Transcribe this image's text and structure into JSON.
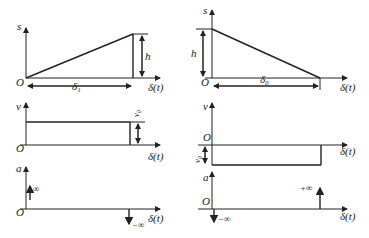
{
  "figure": {
    "left": {
      "displacement": {
        "y_label": "s",
        "origin": "O",
        "x_label": "δ(t)",
        "height_label": "h",
        "interval_label": "δ₁"
      },
      "velocity": {
        "y_label": "v",
        "origin": "O",
        "x_label": "δ(t)",
        "value_label": "v₀"
      },
      "acceleration": {
        "y_label": "a",
        "origin": "O",
        "x_label": "δ(t)",
        "start_impulse": "∞",
        "end_impulse": "−∞"
      }
    },
    "right": {
      "displacement": {
        "y_label": "s",
        "origin": "O",
        "x_label": "δ(t)",
        "height_label": "h",
        "interval_label": "δ₀"
      },
      "velocity": {
        "y_label": "v",
        "origin": "O",
        "x_label": "δ(t)",
        "value_label": "v₀"
      },
      "acceleration": {
        "y_label": "a",
        "origin": "O",
        "x_label": "δ(t)",
        "start_impulse": "−∞",
        "end_impulse": "+∞"
      }
    }
  }
}
